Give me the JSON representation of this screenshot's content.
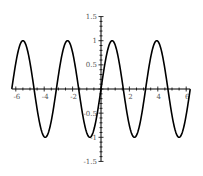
{
  "chart_data": {
    "type": "line",
    "title": "",
    "xlabel": "",
    "ylabel": "",
    "function": "sin(2x)",
    "xlim": [
      -6.283,
      6.283
    ],
    "ylim": [
      -1.5,
      1.5
    ],
    "grid": false,
    "legend": null,
    "x_ticks": [
      -6,
      -4,
      -2,
      0,
      2,
      4,
      6
    ],
    "x_tick_labels": [
      "-6",
      "-4",
      "-2",
      "",
      "2",
      "4",
      "6"
    ],
    "y_ticks": [
      -1.5,
      -1,
      -0.5,
      0.5,
      1,
      1.5
    ],
    "y_tick_labels": [
      "-1.5",
      "-1",
      "-0.5",
      "0.5",
      "1",
      "1.5"
    ],
    "series": [
      {
        "name": "sin(2x)",
        "color": "#000000",
        "x": [
          -6.283,
          -5.498,
          -4.712,
          -3.927,
          -3.142,
          -2.356,
          -1.571,
          -0.785,
          0,
          0.785,
          1.571,
          2.356,
          3.142,
          3.927,
          4.712,
          5.498,
          6.283
        ],
        "values": [
          0,
          1,
          0,
          -1,
          0,
          1,
          0,
          -1,
          0,
          1,
          0,
          -1,
          0,
          1,
          0,
          -1,
          0
        ]
      }
    ]
  }
}
